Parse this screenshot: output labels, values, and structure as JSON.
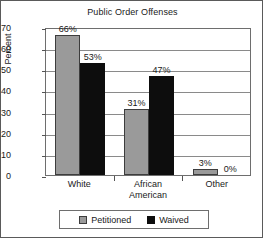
{
  "chart_data": {
    "type": "bar",
    "title": "Public Order Offenses",
    "xlabel": "",
    "ylabel": "Percent",
    "ylim": [
      0,
      70
    ],
    "ytick_step": 10,
    "yticks": [
      70,
      60,
      50,
      40,
      30,
      20,
      10,
      0
    ],
    "ytick_labels": [
      "70",
      "60",
      "50",
      "40",
      "30",
      "20",
      "10",
      "0"
    ],
    "grid": true,
    "grid_axis": "y",
    "legend_position": "bottom",
    "categories": [
      "White",
      "African American",
      "Other"
    ],
    "category_lines": [
      [
        "White"
      ],
      [
        "African",
        "American"
      ],
      [
        "Other"
      ]
    ],
    "series": [
      {
        "name": "Petitioned",
        "color": "#9a9a9a",
        "values": [
          66,
          31,
          3
        ],
        "data_labels": [
          "66%",
          "31%",
          "3%"
        ]
      },
      {
        "name": "Waived",
        "color": "#0d0d0d",
        "values": [
          53,
          47,
          0
        ],
        "data_labels": [
          "53%",
          "47%",
          "0%"
        ]
      }
    ]
  },
  "legend": {
    "items": [
      {
        "label": "Petitioned",
        "swatch": "petitioned"
      },
      {
        "label": "Waived",
        "swatch": "waived"
      }
    ]
  }
}
